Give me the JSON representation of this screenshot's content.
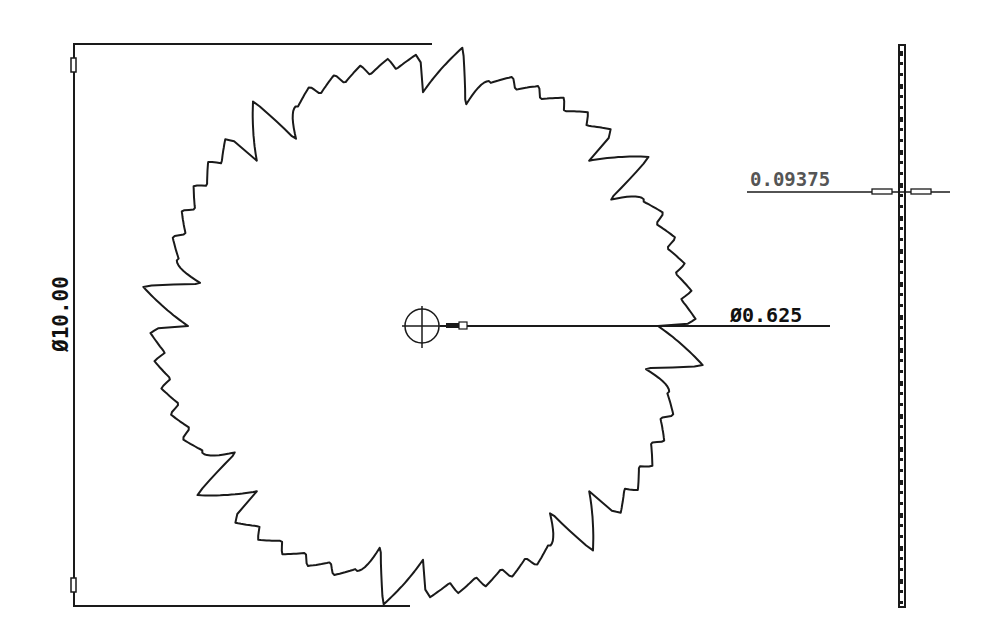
{
  "drawing": {
    "title": "Circular saw blade",
    "units_note": "",
    "front_view": {
      "center": [
        423,
        326
      ],
      "outer_radius_px": 283,
      "tooth_count": 40,
      "arbor_radius_px": 17
    },
    "side_view": {
      "x": 902,
      "top": 45,
      "bottom": 607,
      "thickness_px": 5
    }
  },
  "dimensions": {
    "outer_diameter": {
      "symbol": "Ø",
      "value": "10.00",
      "label": "Ø10.00",
      "orientation": "vertical"
    },
    "arbor_diameter": {
      "symbol": "Ø",
      "value": "0.625",
      "label": "Ø0.625"
    },
    "blade_thickness": {
      "value": "0.09375",
      "label": "0.09375"
    }
  },
  "colors": {
    "line": "#1a1a1a",
    "background": "#ffffff",
    "thickness_text": "#555555"
  }
}
